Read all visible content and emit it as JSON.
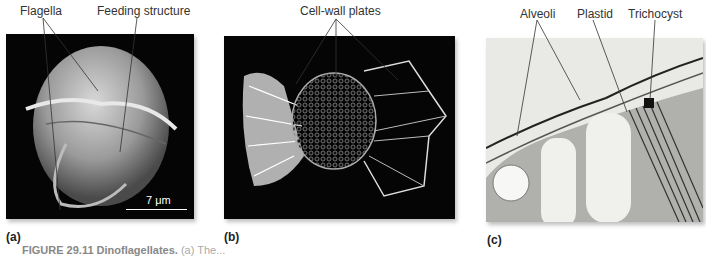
{
  "figure": {
    "panels": [
      {
        "id": "a",
        "label": "(a)",
        "description": "SEM of a dinoflagellate cell, grayscale on black background",
        "callouts": [
          "Flagella",
          "Feeding structure"
        ],
        "scale_bar": "7 μm"
      },
      {
        "id": "b",
        "label": "(b)",
        "description": "SEM of armored dinoflagellate with cell-wall plates on black background",
        "callouts": [
          "Cell-wall plates"
        ]
      },
      {
        "id": "c",
        "label": "(c)",
        "description": "TEM cross-section showing alveoli, plastid and trichocyst",
        "callouts": [
          "Alveoli",
          "Plastid",
          "Trichocyst"
        ]
      }
    ],
    "caption": {
      "title": "FIGURE 29.11 Dinoflagellates.",
      "text": "(a) The..."
    }
  }
}
